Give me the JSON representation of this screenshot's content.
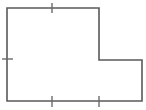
{
  "figure": {
    "name": "l-shaped-polygon",
    "canvas": {
      "width": 146,
      "height": 110,
      "background": "#ffffff"
    },
    "outline": {
      "stroke_color": "#595959",
      "stroke_width": 1.6,
      "points": "7,8 99,8 99,60 142,60 142,101 7,101",
      "vertices": [
        {
          "name": "top-left",
          "x": 7,
          "y": 8
        },
        {
          "name": "top-right",
          "x": 99,
          "y": 8
        },
        {
          "name": "inner-step",
          "x": 99,
          "y": 60
        },
        {
          "name": "right-upper",
          "x": 142,
          "y": 60
        },
        {
          "name": "bottom-right",
          "x": 142,
          "y": 101
        },
        {
          "name": "bottom-left",
          "x": 7,
          "y": 101
        }
      ]
    },
    "ticks": [
      {
        "name": "tick-top-edge",
        "orientation": "vertical",
        "x1": 52,
        "y1": 3,
        "x2": 52,
        "y2": 13,
        "color": "#6b6b6b",
        "width": 1.4
      },
      {
        "name": "tick-left-edge",
        "orientation": "horizontal",
        "x1": 2,
        "y1": 59,
        "x2": 13,
        "y2": 59,
        "color": "#6b6b6b",
        "width": 1.4
      },
      {
        "name": "tick-bottom-edge-left",
        "orientation": "vertical",
        "x1": 52,
        "y1": 96,
        "x2": 52,
        "y2": 107,
        "color": "#6b6b6b",
        "width": 1.4
      },
      {
        "name": "tick-bottom-edge-right",
        "orientation": "vertical",
        "x1": 99,
        "y1": 96,
        "x2": 99,
        "y2": 107,
        "color": "#6b6b6b",
        "width": 1.4
      }
    ]
  }
}
